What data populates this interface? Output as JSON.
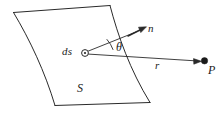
{
  "figure": {
    "stroke_color": "#2a2a2a",
    "background_color": "#ffffff",
    "labels": {
      "ds": "ds",
      "normal": "n",
      "theta": "θ",
      "r": "r",
      "point": "P",
      "surface": "S"
    },
    "elements": {
      "surface_name": "curved-surface-S",
      "element_marker": "open-circle-ds",
      "point_marker": "filled-dot-P",
      "normal_arrow": "arrow-n",
      "r_arrow": "arrow-r",
      "angle_arc": "angle-arc-theta"
    },
    "geometry": {
      "ds_point": [
        85,
        53
      ],
      "p_point": [
        204,
        61
      ],
      "normal_tip": [
        144,
        28
      ],
      "theta_degrees": 30
    }
  }
}
